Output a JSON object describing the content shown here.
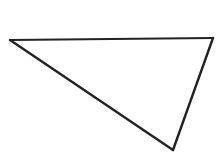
{
  "figure": {
    "kind": "line-drawing",
    "background_color": "#ffffff",
    "stroke_color": "#232326",
    "fill_color": "none",
    "canvas": {
      "width": 221,
      "height": 158
    },
    "shape": {
      "name": "triangle",
      "closed": true,
      "stroke_width": 2.2,
      "vertices": [
        {
          "label": "left-vertex",
          "x": 10,
          "y": 40
        },
        {
          "label": "top-right-vertex",
          "x": 213,
          "y": 38
        },
        {
          "label": "bottom-vertex",
          "x": 173,
          "y": 150
        }
      ],
      "edges": [
        {
          "name": "top-edge",
          "from": "left-vertex",
          "to": "top-right-vertex",
          "stroke_width": 1.9
        },
        {
          "name": "right-edge",
          "from": "top-right-vertex",
          "to": "bottom-vertex",
          "stroke_width": 2.4
        },
        {
          "name": "hypotenuse-edge",
          "from": "bottom-vertex",
          "to": "left-vertex",
          "stroke_width": 2.4
        }
      ]
    },
    "labels": [],
    "annotations": []
  }
}
